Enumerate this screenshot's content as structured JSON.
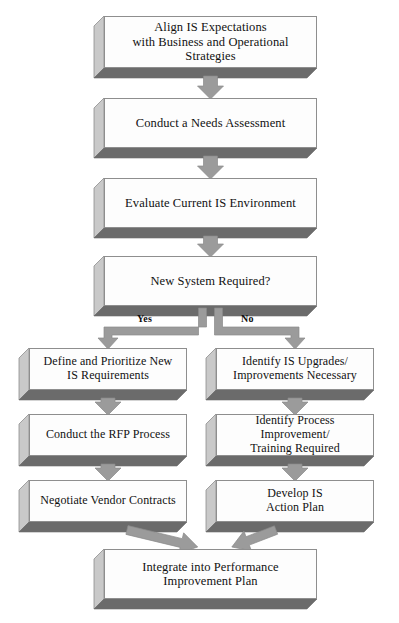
{
  "diagram": {
    "type": "flowchart",
    "orientation": "top-to-bottom",
    "colors": {
      "box_face": "#fdfdfd",
      "box_outline": "#8e8e8e",
      "box_side": "#c9c9c9",
      "box_shadow": "#6b6b6b",
      "arrow": "#9b9b9b",
      "arrow_outline": "#8a8a8a",
      "text": "#111111",
      "background": "#ffffff"
    },
    "nodes": [
      {
        "id": "align",
        "text": "Align IS Expectations\nwith Business and Operational Strategies",
        "x": 104,
        "y": 16,
        "w": 213,
        "h": 52,
        "font_size": 12.5,
        "column": "center"
      },
      {
        "id": "needs",
        "text": "Conduct a Needs Assessment",
        "x": 104,
        "y": 98,
        "w": 213,
        "h": 50,
        "font_size": 12.5,
        "column": "center"
      },
      {
        "id": "evaluate",
        "text": "Evaluate Current IS Environment",
        "x": 104,
        "y": 178,
        "w": 213,
        "h": 50,
        "font_size": 12.5,
        "column": "center"
      },
      {
        "id": "decision",
        "text": "New System Required?",
        "x": 104,
        "y": 256,
        "w": 213,
        "h": 50,
        "font_size": 12.5,
        "column": "center"
      },
      {
        "id": "define",
        "text": "Define and Prioritize New\nIS Requirements",
        "x": 29,
        "y": 348,
        "w": 158,
        "h": 42,
        "font_size": 12,
        "column": "left"
      },
      {
        "id": "upstrategy",
        "text": "Identify IS Upgrades/\nImprovements Necessary",
        "x": 216,
        "y": 348,
        "w": 158,
        "h": 42,
        "font_size": 12,
        "column": "right"
      },
      {
        "id": "rfp",
        "text": "Conduct the RFP Process",
        "x": 29,
        "y": 414,
        "w": 158,
        "h": 42,
        "font_size": 12,
        "column": "left"
      },
      {
        "id": "training",
        "text": "Identify Process Improvement/\nTraining Required",
        "x": 216,
        "y": 414,
        "w": 158,
        "h": 42,
        "font_size": 12,
        "column": "right"
      },
      {
        "id": "negotiate",
        "text": "Negotiate Vendor Contracts",
        "x": 29,
        "y": 480,
        "w": 158,
        "h": 42,
        "font_size": 12,
        "column": "left"
      },
      {
        "id": "actionplan",
        "text": "Develop IS\nAction Plan",
        "x": 216,
        "y": 480,
        "w": 158,
        "h": 42,
        "font_size": 12,
        "column": "right"
      },
      {
        "id": "integrate",
        "text": "Integrate into Performance\nImprovement Plan",
        "x": 104,
        "y": 549,
        "w": 213,
        "h": 50,
        "font_size": 12.5,
        "column": "center"
      }
    ],
    "branch_labels": [
      {
        "id": "yes",
        "text": "Yes",
        "x": 137,
        "y": 313
      },
      {
        "id": "no",
        "text": "No",
        "x": 241,
        "y": 313
      }
    ],
    "edges": [
      {
        "from": "align",
        "to": "needs",
        "kind": "vertical"
      },
      {
        "from": "needs",
        "to": "evaluate",
        "kind": "vertical"
      },
      {
        "from": "evaluate",
        "to": "decision",
        "kind": "vertical"
      },
      {
        "from": "decision",
        "to": "define",
        "kind": "elbow-left",
        "label": "Yes"
      },
      {
        "from": "decision",
        "to": "upstrategy",
        "kind": "elbow-right",
        "label": "No"
      },
      {
        "from": "define",
        "to": "rfp",
        "kind": "vertical"
      },
      {
        "from": "rfp",
        "to": "negotiate",
        "kind": "vertical"
      },
      {
        "from": "upstrategy",
        "to": "training",
        "kind": "vertical"
      },
      {
        "from": "training",
        "to": "actionplan",
        "kind": "vertical"
      },
      {
        "from": "negotiate",
        "to": "integrate",
        "kind": "diagonal-right"
      },
      {
        "from": "actionplan",
        "to": "integrate",
        "kind": "diagonal-left"
      }
    ]
  }
}
